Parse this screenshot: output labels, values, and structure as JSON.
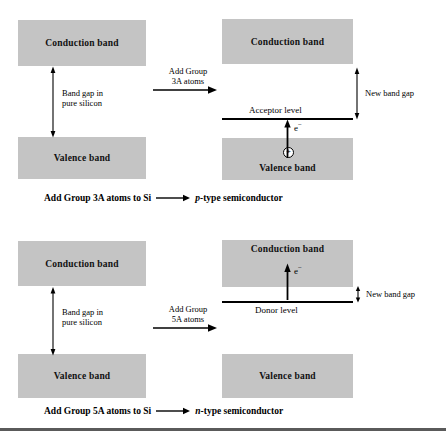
{
  "figure": {
    "colors": {
      "band_fill": "#c4c4c4",
      "line": "#000000",
      "rule": "#5a5a5a",
      "background": "#ffffff"
    },
    "rows": [
      {
        "id": "p-type",
        "left_diagram": {
          "conduction_band_label": "Conduction band",
          "valence_band_label": "Valence band",
          "gap_note_line1": "Band gap in",
          "gap_note_line2": "pure silicon"
        },
        "process_arrow": {
          "label_line1": "Add Group",
          "label_line2": "3A atoms"
        },
        "right_diagram": {
          "conduction_band_label": "Conduction band",
          "valence_band_label": "Valence band",
          "dopant_level_label": "Acceptor level",
          "carrier_label": "e",
          "carrier_superscript": "−",
          "charge_symbol": "+",
          "new_gap_note": "New band gap"
        },
        "caption": {
          "lead": "Add Group 3A atoms to Si",
          "arrow": "⟶",
          "result_italic": "p",
          "result_rest": "-type semiconductor"
        }
      },
      {
        "id": "n-type",
        "left_diagram": {
          "conduction_band_label": "Conduction band",
          "valence_band_label": "Valence band",
          "gap_note_line1": "Band gap in",
          "gap_note_line2": "pure silicon"
        },
        "process_arrow": {
          "label_line1": "Add Group",
          "label_line2": "5A atoms"
        },
        "right_diagram": {
          "conduction_band_label": "Conduction band",
          "valence_band_label": "Valence band",
          "dopant_level_label": "Donor level",
          "carrier_label": "e",
          "carrier_superscript": "−",
          "new_gap_note": "New band gap"
        },
        "caption": {
          "lead": "Add Group 5A atoms to Si",
          "arrow": "⟶",
          "result_italic": "n",
          "result_rest": "-type semiconductor"
        }
      }
    ]
  }
}
